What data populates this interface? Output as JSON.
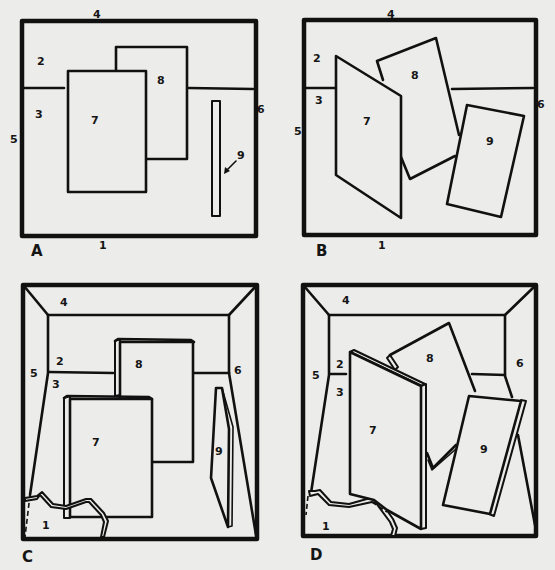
{
  "figure": {
    "colors": {
      "background": "#ececea",
      "ink": "#111111"
    },
    "panels": [
      {
        "id": "A",
        "label": "A",
        "numbers": {
          "n1": "1",
          "n2": "2",
          "n3": "3",
          "n4": "4",
          "n5": "5",
          "n6": "6",
          "n7": "7",
          "n8": "8",
          "n9": "9"
        }
      },
      {
        "id": "B",
        "label": "B",
        "numbers": {
          "n1": "1",
          "n2": "2",
          "n3": "3",
          "n4": "4",
          "n5": "5",
          "n6": "6",
          "n7": "7",
          "n8": "8",
          "n9": "9"
        }
      },
      {
        "id": "C",
        "label": "C",
        "numbers": {
          "n1": "1",
          "n2": "2",
          "n3": "3",
          "n4": "4",
          "n5": "5",
          "n6": "6",
          "n7": "7",
          "n8": "8",
          "n9": "9"
        }
      },
      {
        "id": "D",
        "label": "D",
        "numbers": {
          "n1": "1",
          "n2": "2",
          "n3": "3",
          "n4": "4",
          "n5": "5",
          "n6": "6",
          "n7": "7",
          "n8": "8",
          "n9": "9"
        }
      }
    ]
  }
}
